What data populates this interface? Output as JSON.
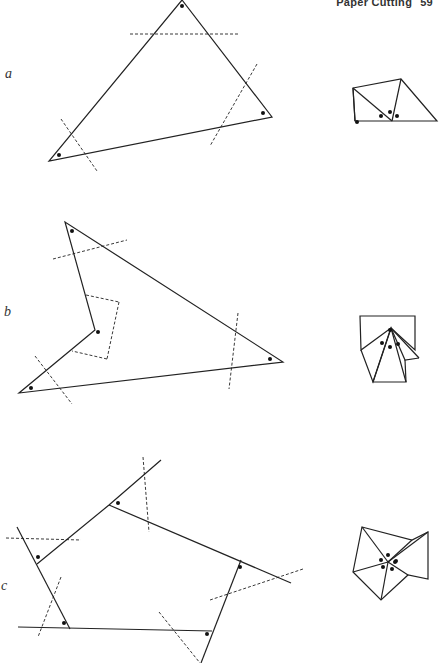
{
  "header": {
    "title": "Paper Cutting",
    "page_number": "59"
  },
  "figures": [
    {
      "label": "a",
      "description": "Triangle with three corners marked by dots; dashed cut lines across each corner; pieces rearranged at right so the three angles meet at a point forming a straight line."
    },
    {
      "label": "b",
      "description": "Concave quadrilateral with four marked corners; dashed cut lines; corners rearranged at right to meet at a point summing to 360 degrees."
    },
    {
      "label": "c",
      "description": "Pentagon-like figure with extended sides forming exterior angles marked by dots; dashed cut lines; exterior-angle pieces rearranged at right meeting at a point."
    }
  ]
}
